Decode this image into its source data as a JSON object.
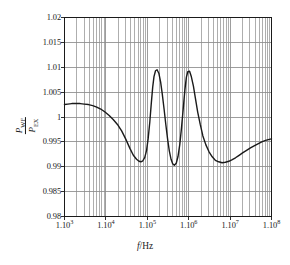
{
  "figure": {
    "name": "power-ratio-vs-frequency-plot",
    "ink_color": "#1a1a1a",
    "grid_color": "#8c8c8c",
    "background": "#ffffff"
  },
  "axis_titles": {
    "x": {
      "symbol": "f",
      "unit": "Hz",
      "separator": "/"
    },
    "y": {
      "numerator_symbol": "P",
      "numerator_subscript": "WF",
      "denominator_symbol": "P",
      "denominator_subscript": "EX"
    }
  },
  "chart_data": {
    "type": "line",
    "title": "",
    "subtitle": "",
    "xlabel": "f/Hz",
    "ylabel": "P_WF / P_EX",
    "xscale": "log",
    "yscale": "linear",
    "xlim": [
      1000,
      100000000
    ],
    "ylim": [
      0.98,
      1.02
    ],
    "grid": true,
    "grid_minor_x": true,
    "grid_major_y": true,
    "legend": null,
    "legend_position": "none",
    "xtick_labels": [
      "1.10",
      "1.10",
      "1.10",
      "1.10",
      "1.10",
      "1.10"
    ],
    "xtick_exponents": [
      "3",
      "4",
      "5",
      "6",
      "7",
      "8"
    ],
    "xtick_values": [
      1000,
      10000,
      100000,
      1000000,
      10000000,
      100000000
    ],
    "ytick_labels": [
      "1.02",
      "1.015",
      "1.01",
      "1.005",
      "1",
      "0.995",
      "0.99",
      "0.985",
      "0.98"
    ],
    "ytick_values": [
      1.02,
      1.015,
      1.01,
      1.005,
      1.0,
      0.995,
      0.99,
      0.985,
      0.98
    ],
    "series": [
      {
        "name": "P_WF/P_EX",
        "color": "#1a1a1a",
        "linewidth": 1.4,
        "x": [
          1000,
          1200,
          1500,
          1900,
          2400,
          3000,
          3800,
          4800,
          6000,
          7500,
          9500,
          12000,
          15000,
          19000,
          24000,
          30000,
          38000,
          46000,
          55000,
          63000,
          70000,
          78000,
          87000,
          96000,
          105000,
          115000,
          125000,
          135000,
          145000,
          158000,
          172000,
          190000,
          210000,
          230000,
          255000,
          280000,
          310000,
          340000,
          375000,
          410000,
          450000,
          500000,
          550000,
          610000,
          670000,
          740000,
          810000,
          880000,
          950000,
          1050000,
          1150000,
          1300000,
          1450000,
          1650000,
          1900000,
          2200000,
          2600000,
          3100000,
          3700000,
          4400000,
          5300000,
          6400000,
          7700000,
          9300000,
          11000000,
          13500000,
          16500000,
          20000000,
          25000000,
          31000000,
          38000000,
          47000000,
          58000000,
          72000000,
          88000000,
          100000000
        ],
        "y": [
          1.0025,
          1.0026,
          1.0027,
          1.0027,
          1.0027,
          1.0026,
          1.0025,
          1.0023,
          1.002,
          1.0016,
          1.001,
          1.0003,
          0.9995,
          0.9985,
          0.9972,
          0.9956,
          0.9937,
          0.9923,
          0.9915,
          0.9911,
          0.991,
          0.9912,
          0.9919,
          0.9933,
          0.9957,
          0.999,
          1.0028,
          1.006,
          1.0081,
          1.0093,
          1.0095,
          1.0088,
          1.007,
          1.0046,
          1.0015,
          0.9985,
          0.9955,
          0.9932,
          0.9915,
          0.9906,
          0.9903,
          0.9907,
          0.992,
          0.9945,
          0.9978,
          1.0018,
          1.0055,
          1.008,
          1.0091,
          1.0092,
          1.0082,
          1.0062,
          1.0038,
          1.001,
          0.9985,
          0.9962,
          0.9944,
          0.993,
          0.992,
          0.9913,
          0.991,
          0.9908,
          0.9909,
          0.9911,
          0.9914,
          0.9918,
          0.9923,
          0.9928,
          0.9933,
          0.9938,
          0.9942,
          0.9946,
          0.995,
          0.9953,
          0.9955,
          0.9956
        ],
        "features": {
          "initial_value": 1.0025,
          "plateau_value": 1.0027,
          "minimum_1": {
            "x": 70000,
            "y": 0.991
          },
          "maximum_1": {
            "x": 172000,
            "y": 1.0095
          },
          "minimum_2": {
            "x": 450000,
            "y": 0.9903
          },
          "maximum_2": {
            "x": 1050000,
            "y": 1.0092
          },
          "minimum_3": {
            "x": 6400000,
            "y": 0.9908
          },
          "final_value": 0.9956
        }
      }
    ]
  }
}
